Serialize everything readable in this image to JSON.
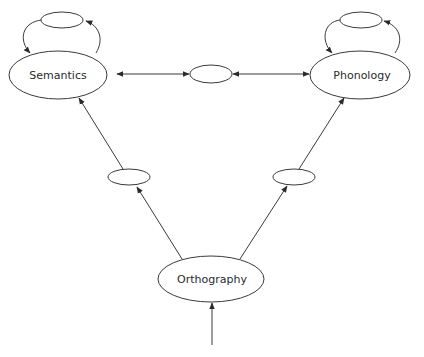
{
  "diagram": {
    "title": "",
    "nodes": [
      {
        "id": "semantics",
        "label": "Semantics"
      },
      {
        "id": "phonology",
        "label": "Phonology"
      },
      {
        "id": "orthography",
        "label": "Orthography"
      },
      {
        "id": "hidden-sem-loop",
        "label": ""
      },
      {
        "id": "hidden-phon-loop",
        "label": ""
      },
      {
        "id": "hidden-sem-phon",
        "label": ""
      },
      {
        "id": "hidden-orth-sem",
        "label": ""
      },
      {
        "id": "hidden-orth-phon",
        "label": ""
      }
    ],
    "edges": [
      {
        "from": "input",
        "to": "orthography",
        "direction": "forward"
      },
      {
        "from": "orthography",
        "to": "hidden-orth-sem",
        "direction": "forward"
      },
      {
        "from": "hidden-orth-sem",
        "to": "semantics",
        "direction": "forward"
      },
      {
        "from": "orthography",
        "to": "hidden-orth-phon",
        "direction": "forward"
      },
      {
        "from": "hidden-orth-phon",
        "to": "phonology",
        "direction": "forward"
      },
      {
        "from": "semantics",
        "to": "hidden-sem-phon",
        "direction": "bidirectional"
      },
      {
        "from": "hidden-sem-phon",
        "to": "phonology",
        "direction": "bidirectional"
      },
      {
        "from": "semantics",
        "to": "hidden-sem-loop",
        "direction": "loop"
      },
      {
        "from": "phonology",
        "to": "hidden-phon-loop",
        "direction": "loop"
      }
    ],
    "colors": {
      "stroke": "#3a3a3a",
      "text": "#2a2a2a",
      "background": "#ffffff"
    }
  }
}
